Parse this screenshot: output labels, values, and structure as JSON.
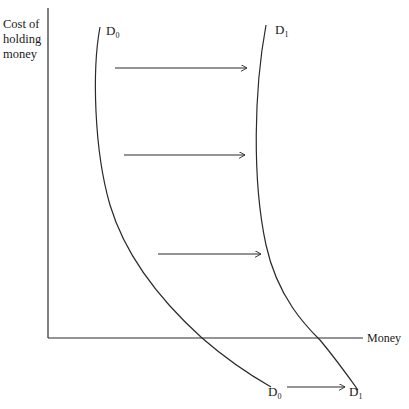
{
  "diagram": {
    "y_axis_label_lines": [
      "Cost of",
      "holding",
      "money"
    ],
    "x_axis_label": "Money",
    "curves": [
      {
        "name": "D0",
        "label_main": "D",
        "label_sub": "0"
      },
      {
        "name": "D1",
        "label_main": "D",
        "label_sub": "1"
      }
    ],
    "shift_direction": "right",
    "arrow_count": 4,
    "colors": {
      "line": "#2a2a2a",
      "background": "#ffffff"
    }
  }
}
